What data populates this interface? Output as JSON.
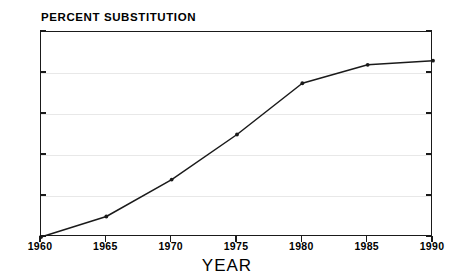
{
  "chart_data": {
    "type": "line",
    "title": "PERCENT SUBSTITUTION",
    "xlabel": "YEAR",
    "ylabel": "",
    "x": [
      1960,
      1965,
      1970,
      1975,
      1980,
      1985,
      1990
    ],
    "values": [
      0,
      10,
      28,
      50,
      75,
      84,
      86
    ],
    "series": [
      {
        "name": "Percent substitution",
        "values": [
          0,
          10,
          28,
          50,
          75,
          84,
          86
        ]
      }
    ],
    "xlim": [
      1960,
      1990
    ],
    "ylim": [
      0,
      100
    ],
    "x_tick_labels": [
      "1960",
      "1965",
      "1970",
      "1975",
      "1980",
      "1985",
      "1990"
    ],
    "y_tick_labels": [
      "0",
      "20",
      "40",
      "60",
      "80",
      "100"
    ],
    "y_ticks": [
      0,
      20,
      40,
      60,
      80,
      100
    ],
    "grid": true,
    "gridlines_at": [
      20,
      40,
      60,
      80
    ],
    "legend": null,
    "legend_position": "none",
    "markers": true,
    "line_color": "#1a1a1a",
    "grid_color": "#e8e8e8",
    "background_color": "#ffffff"
  }
}
